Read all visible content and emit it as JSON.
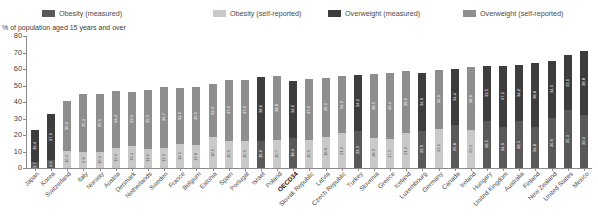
{
  "legend": {
    "items": [
      {
        "label": "Obesity (measured)",
        "color": "#595959",
        "name": "legend-obesity-measured"
      },
      {
        "label": "Obesity (self-reported)",
        "color": "#c9c9c9",
        "name": "legend-obesity-self-reported"
      },
      {
        "label": "Overweight (measured)",
        "color": "#3d3d3d",
        "name": "legend-overweight-measured"
      },
      {
        "label": "Overweight (self-reported)",
        "color": "#8e8e8e",
        "name": "legend-overweight-self-reported"
      }
    ]
  },
  "axis": {
    "ylabel": "% of population aged 15 years and over",
    "yticks": [
      "80",
      "70",
      "60",
      "50",
      "40",
      "30",
      "20",
      "10",
      "0"
    ]
  },
  "chart_data": {
    "type": "bar",
    "title": "",
    "subtitle": "",
    "xlabel": "",
    "ylabel": "% of population aged 15 years and over",
    "ylim": [
      0,
      80
    ],
    "ytick_step": 10,
    "grid": false,
    "legend_position": "top",
    "stacked": true,
    "highlight_category": "OECD34",
    "series": [
      {
        "name": "Obesity",
        "stack_position": "bottom"
      },
      {
        "name": "Overweight",
        "stack_position": "top"
      }
    ],
    "categories": [
      "Japan",
      "Korea",
      "Switzerland",
      "Italy",
      "Norway",
      "Austria",
      "Denmark",
      "Netherlands",
      "Sweden",
      "France",
      "Belgium",
      "Estonia",
      "Spain",
      "Portugal",
      "Israel",
      "Poland",
      "OECD34",
      "Slovak Republic",
      "Latvia",
      "Czech Republic",
      "Turkey",
      "Slovenia",
      "Greece",
      "Iceland",
      "Luxembourg",
      "Germany",
      "Canada",
      "Ireland",
      "Hungary",
      "United Kingdom",
      "Australia",
      "Finland",
      "New Zealand",
      "United States",
      "Mexico"
    ],
    "measurement_type": [
      "measured",
      "measured",
      "self-reported",
      "self-reported",
      "self-reported",
      "self-reported",
      "self-reported",
      "self-reported",
      "self-reported",
      "self-reported",
      "self-reported",
      "self-reported",
      "self-reported",
      "self-reported",
      "measured",
      "self-reported",
      "measured",
      "self-reported",
      "self-reported",
      "self-reported",
      "measured",
      "self-reported",
      "self-reported",
      "self-reported",
      "measured",
      "self-reported",
      "measured",
      "self-reported",
      "measured",
      "measured",
      "measured",
      "measured",
      "measured",
      "measured",
      "measured"
    ],
    "obesity": [
      3.7,
      4.6,
      10.3,
      9.8,
      10.0,
      12.4,
      13.4,
      11.8,
      12.3,
      14.5,
      13.8,
      18.6,
      16.6,
      16.6,
      16.6,
      16.7,
      18.4,
      16.9,
      18.8,
      21.0,
      22.3,
      18.3,
      17.3,
      21.0,
      22.5,
      23.6,
      25.8,
      23.0,
      28.5,
      24.9,
      28.3,
      24.8,
      30.6,
      35.3,
      32.4
    ],
    "overweight": [
      19.4,
      27.9,
      30.3,
      35.3,
      35.0,
      34.4,
      32.4,
      35.5,
      36.7,
      34.0,
      35.5,
      32.4,
      37.0,
      37.0,
      38.6,
      38.8,
      34.6,
      37.0,
      36.0,
      34.9,
      34.2,
      38.5,
      40.4,
      38.0,
      34.9,
      36.0,
      34.4,
      38.0,
      33.5,
      37.1,
      34.2,
      38.8,
      34.1,
      33.0,
      38.8
    ],
    "totals": [
      23.1,
      32.5,
      40.6,
      45.1,
      45.0,
      46.8,
      45.8,
      47.3,
      49.0,
      48.5,
      49.3,
      51.0,
      53.6,
      53.6,
      55.2,
      55.5,
      53.0,
      53.9,
      54.8,
      55.9,
      56.5,
      56.8,
      57.7,
      59.0,
      57.4,
      59.6,
      60.2,
      61.0,
      62.0,
      62.0,
      62.5,
      63.6,
      64.7,
      68.3,
      71.2
    ]
  }
}
